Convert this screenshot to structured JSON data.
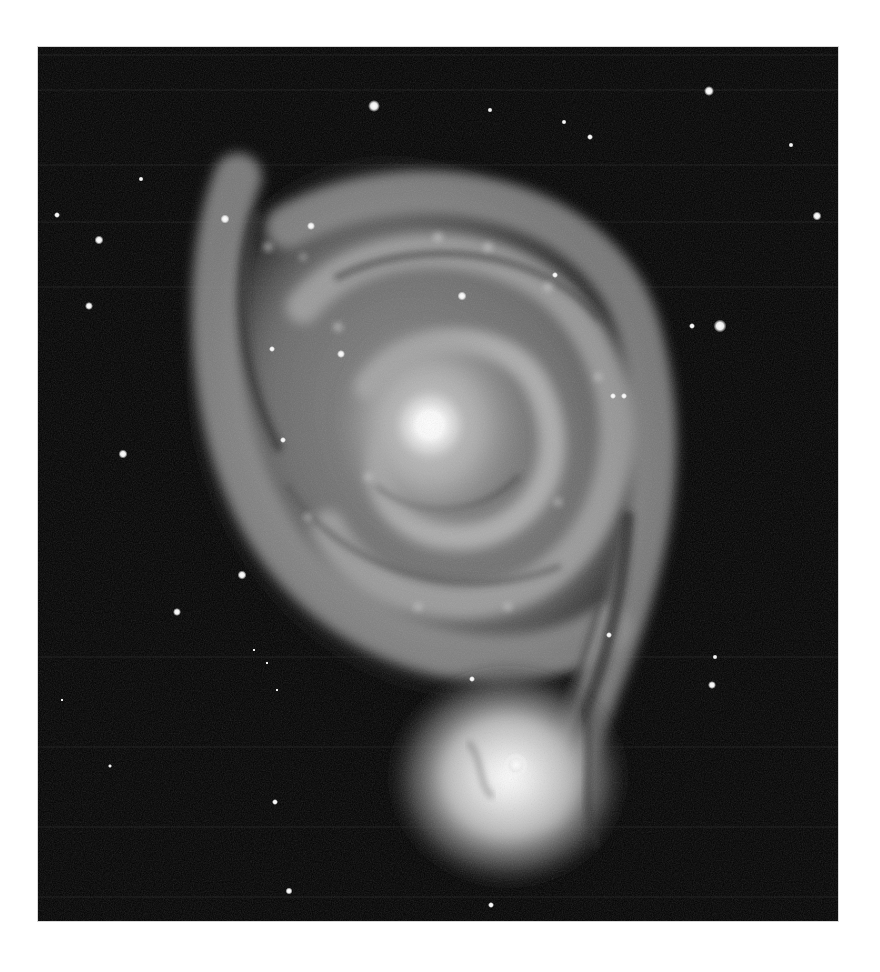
{
  "image": {
    "subject": "Whirlpool Galaxy (M51) with companion galaxy",
    "style": "grayscale astronomical photograph",
    "frame": {
      "x": 38,
      "y": 47,
      "width": 800,
      "height": 874
    },
    "colors": {
      "page_background": "#ffffff",
      "sky": "#020202",
      "galaxy_core": "#ffffff",
      "galaxy_arm": "#9a9a9a",
      "dust_lane": "#3a3a3a",
      "star": "#f2f2f2"
    },
    "main_galaxy": {
      "core_x": 430,
      "core_y": 425
    },
    "companion_galaxy": {
      "core_x": 515,
      "core_y": 765
    },
    "stars": [
      {
        "x": 374,
        "y": 106,
        "r": 5
      },
      {
        "x": 709,
        "y": 91,
        "r": 4
      },
      {
        "x": 490,
        "y": 110,
        "r": 2
      },
      {
        "x": 564,
        "y": 122,
        "r": 2
      },
      {
        "x": 590,
        "y": 137,
        "r": 2.5
      },
      {
        "x": 791,
        "y": 145,
        "r": 2
      },
      {
        "x": 141,
        "y": 179,
        "r": 2
      },
      {
        "x": 57,
        "y": 215,
        "r": 2.5
      },
      {
        "x": 99,
        "y": 240,
        "r": 3.5
      },
      {
        "x": 817,
        "y": 216,
        "r": 3.5
      },
      {
        "x": 89,
        "y": 306,
        "r": 3
      },
      {
        "x": 720,
        "y": 326,
        "r": 5
      },
      {
        "x": 692,
        "y": 326,
        "r": 2.5
      },
      {
        "x": 123,
        "y": 454,
        "r": 3.5
      },
      {
        "x": 242,
        "y": 575,
        "r": 3.5
      },
      {
        "x": 177,
        "y": 612,
        "r": 3
      },
      {
        "x": 712,
        "y": 685,
        "r": 3
      },
      {
        "x": 715,
        "y": 657,
        "r": 2
      },
      {
        "x": 110,
        "y": 766,
        "r": 2
      },
      {
        "x": 275,
        "y": 802,
        "r": 2.5
      },
      {
        "x": 289,
        "y": 891,
        "r": 3
      },
      {
        "x": 62,
        "y": 700,
        "r": 1.5
      },
      {
        "x": 254,
        "y": 650,
        "r": 1.5
      },
      {
        "x": 267,
        "y": 663,
        "r": 1.5
      },
      {
        "x": 277,
        "y": 690,
        "r": 1.5
      },
      {
        "x": 491,
        "y": 905,
        "r": 2.5
      },
      {
        "x": 225,
        "y": 219,
        "r": 3.5
      },
      {
        "x": 311,
        "y": 226,
        "r": 3
      },
      {
        "x": 462,
        "y": 296,
        "r": 3.5
      },
      {
        "x": 341,
        "y": 354,
        "r": 3
      },
      {
        "x": 272,
        "y": 349,
        "r": 2.5
      },
      {
        "x": 283,
        "y": 440,
        "r": 2.5
      },
      {
        "x": 613,
        "y": 396,
        "r": 2.5
      },
      {
        "x": 624,
        "y": 396,
        "r": 2.5
      },
      {
        "x": 609,
        "y": 635,
        "r": 2.5
      },
      {
        "x": 555,
        "y": 275,
        "r": 2.5
      },
      {
        "x": 472,
        "y": 679,
        "r": 2.5
      }
    ]
  }
}
